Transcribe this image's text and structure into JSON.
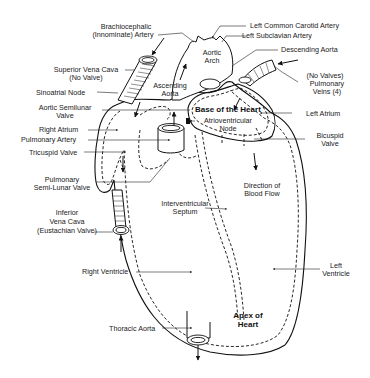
{
  "diagram": {
    "labels": {
      "brachiocephalic": [
        "Brachiocephalic",
        "(Innominate) Artery"
      ],
      "left_common_carotid": "Left Common Carotid Artery",
      "left_subclavian": "Left Subclavian Artery",
      "aortic_arch": [
        "Aortic",
        "Arch"
      ],
      "descending_aorta": "Descending Aorta",
      "superior_vena_cava": [
        "Superior Vena Cava",
        "(No Valve)"
      ],
      "ascending_aorta": [
        "Ascending",
        "Aorta"
      ],
      "sinoatrial_node": "Sinoatrial Node",
      "pulmonary_veins": [
        "(No Valves)",
        "Pulmonary",
        "Veins (4)"
      ],
      "aortic_semilunar": [
        "Aortic Semilunar",
        "Valve"
      ],
      "base_of_heart": "Base of the Heart",
      "atrioventricular_node": [
        "Atrioventricular",
        "Node"
      ],
      "left_atrium": "Left Atrium",
      "right_atrium": "Right Atrium",
      "pulmonary_artery": "Pulmonary Artery",
      "bicuspid_valve": [
        "Bicuspid",
        "Valve"
      ],
      "tricuspid_valve": "Tricuspid Valve",
      "pulmonary_semilunar": [
        "Pulmonary",
        "Semi-Lunar Valve"
      ],
      "direction_of_blood_flow": [
        "Direction of",
        "Blood Flow"
      ],
      "interventricular_septum": [
        "Interventricular",
        "Septum"
      ],
      "inferior_vena_cava": [
        "Inferior",
        "Vena Cava",
        "(Eustachian Valve)"
      ],
      "right_ventricle": "Right Ventricle",
      "left_ventricle": [
        "Left",
        "Ventricle"
      ],
      "apex_of_heart": [
        "Apex of",
        "Heart"
      ],
      "thoracic_aorta": "Thoracic Aorta"
    }
  }
}
